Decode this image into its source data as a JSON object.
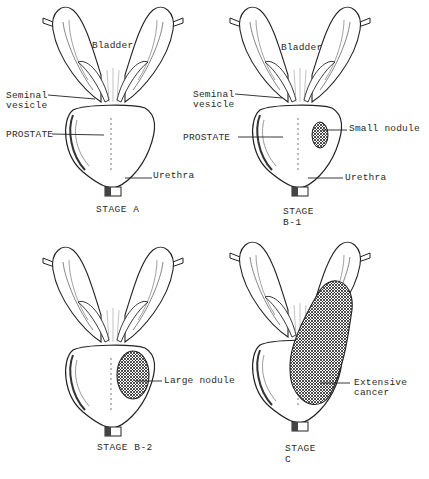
{
  "figure": {
    "panels": [
      {
        "id": "stage-a",
        "stage_label": "STAGE A",
        "labels": {
          "bladder": "Bladder",
          "seminal_vesicle": "Seminal\nvesicle",
          "prostate": "PROSTATE",
          "urethra": "Urethra"
        }
      },
      {
        "id": "stage-b1",
        "stage_label": "STAGE B-1",
        "labels": {
          "bladder": "Bladder",
          "seminal_vesicle": "Seminal\nvesicle",
          "prostate": "PROSTATE",
          "nodule": "Small nodule",
          "urethra": "Urethra"
        }
      },
      {
        "id": "stage-b2",
        "stage_label": "STAGE B-2",
        "labels": {
          "nodule": "Large nodule"
        }
      },
      {
        "id": "stage-c",
        "stage_label": "STAGE C",
        "labels": {
          "cancer": "Extensive\ncancer"
        }
      }
    ]
  },
  "colors": {
    "ink": "#222222",
    "paper": "#ffffff",
    "hatch": "#333333"
  }
}
